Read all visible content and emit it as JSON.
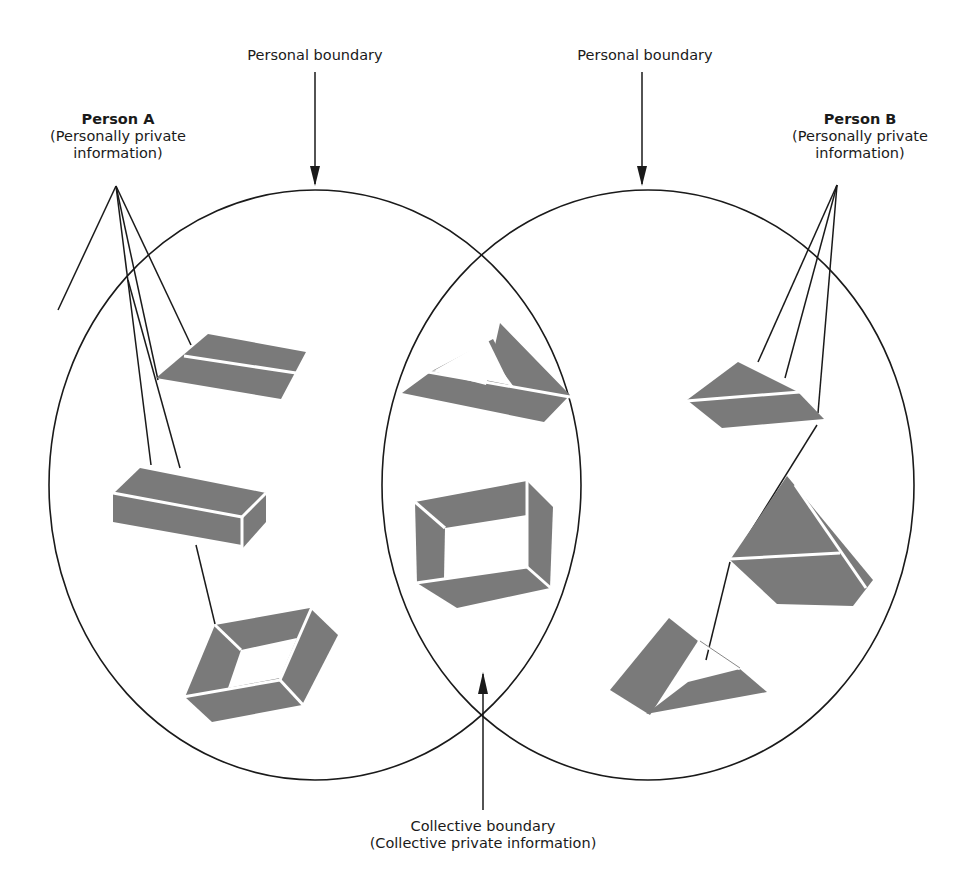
{
  "diagram": {
    "labels": {
      "personal_boundary_left": "Personal boundary",
      "personal_boundary_right": "Personal boundary",
      "person_a": {
        "name": "Person A",
        "line1": "(Personally private",
        "line2": "information)"
      },
      "person_b": {
        "name": "Person B",
        "line1": "(Personally private",
        "line2": "information)"
      },
      "collective": {
        "line1": "Collective boundary",
        "line2": "(Collective private information)"
      }
    },
    "colors": {
      "outline": "#1a1a1a",
      "shape_fill": "#7a7a7a",
      "background": "#ffffff"
    },
    "regions": [
      {
        "id": "person-a-circle",
        "label": "Person A",
        "shapes": [
          "flat-parallelogram",
          "rectangular-block",
          "diamond-frame"
        ]
      },
      {
        "id": "overlap",
        "label": "Collective",
        "shapes": [
          "triangle-frame",
          "rectangle-frame"
        ]
      },
      {
        "id": "person-b-circle",
        "label": "Person B",
        "shapes": [
          "wedge",
          "pyramid",
          "triangle-frame-open"
        ]
      }
    ]
  }
}
